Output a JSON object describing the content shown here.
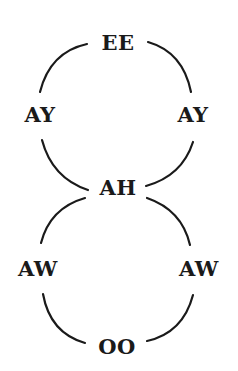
{
  "diagram": {
    "type": "figure-eight vowel cycle",
    "nodes": [
      {
        "id": "ee",
        "label": "EE",
        "x": 118,
        "y": 42
      },
      {
        "id": "ay-left",
        "label": "AY",
        "x": 40,
        "y": 114
      },
      {
        "id": "ay-right",
        "label": "AY",
        "x": 193,
        "y": 114
      },
      {
        "id": "ah",
        "label": "AH",
        "x": 118,
        "y": 187
      },
      {
        "id": "aw-left",
        "label": "AW",
        "x": 38,
        "y": 268
      },
      {
        "id": "aw-right",
        "label": "AW",
        "x": 199,
        "y": 268
      },
      {
        "id": "oo",
        "label": "OO",
        "x": 117,
        "y": 346
      }
    ],
    "edges": [
      [
        "ee",
        "ay-left"
      ],
      [
        "ee",
        "ay-right"
      ],
      [
        "ay-left",
        "ah"
      ],
      [
        "ay-right",
        "ah"
      ],
      [
        "ah",
        "aw-left"
      ],
      [
        "ah",
        "aw-right"
      ],
      [
        "aw-left",
        "oo"
      ],
      [
        "aw-right",
        "oo"
      ]
    ],
    "colors": {
      "line": "#1a1a1a",
      "text": "#1a1a1a",
      "background": "#ffffff"
    }
  }
}
